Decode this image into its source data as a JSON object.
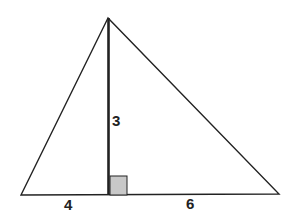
{
  "diagram": {
    "type": "triangle-with-altitude",
    "vertices": {
      "apex": [
        108,
        18
      ],
      "left": [
        21,
        195
      ],
      "right": [
        279,
        194
      ],
      "foot": [
        109,
        195
      ]
    },
    "labels": {
      "altitude": "3",
      "left_segment": "4",
      "right_segment": "6"
    },
    "right_angle_marker_color": "#c8c8c8",
    "line_color": "#222222"
  }
}
